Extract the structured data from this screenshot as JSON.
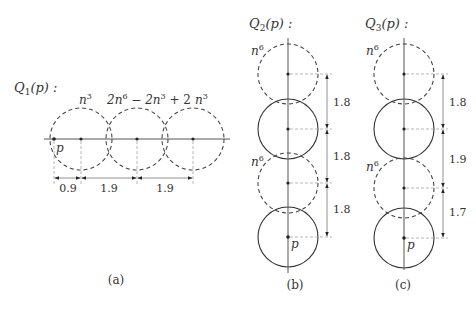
{
  "panels": {
    "a": {
      "title": "Q",
      "title_sub": "1",
      "title_rest": "(p) :",
      "caption": "(a)",
      "point_label": "p",
      "circle_labels": [
        {
          "base": "n",
          "sup": "3"
        },
        {
          "base": "2n",
          "sup": "6",
          "rest": " − 2n",
          "sup2": "3",
          "rest2": " + 2"
        },
        {
          "base": "n",
          "sup": "3"
        }
      ],
      "distances": [
        "0.9",
        "1.9",
        "1.9"
      ]
    },
    "b": {
      "title": "Q",
      "title_sub": "2",
      "title_rest": "(p) :",
      "caption": "(b)",
      "point_label": "p",
      "dashed_labels": [
        {
          "base": "n",
          "sup": "6"
        },
        {
          "base": "n",
          "sup": "6"
        }
      ],
      "distances": [
        "1.8",
        "1.8",
        "1.8"
      ]
    },
    "c": {
      "title": "Q",
      "title_sub": "3",
      "title_rest": "(p) :",
      "caption": "(c)",
      "point_label": "p",
      "dashed_labels": [
        {
          "base": "n",
          "sup": "6"
        },
        {
          "base": "n",
          "sup": "6"
        }
      ],
      "distances": [
        "1.8",
        "1.9",
        "1.7"
      ]
    }
  }
}
